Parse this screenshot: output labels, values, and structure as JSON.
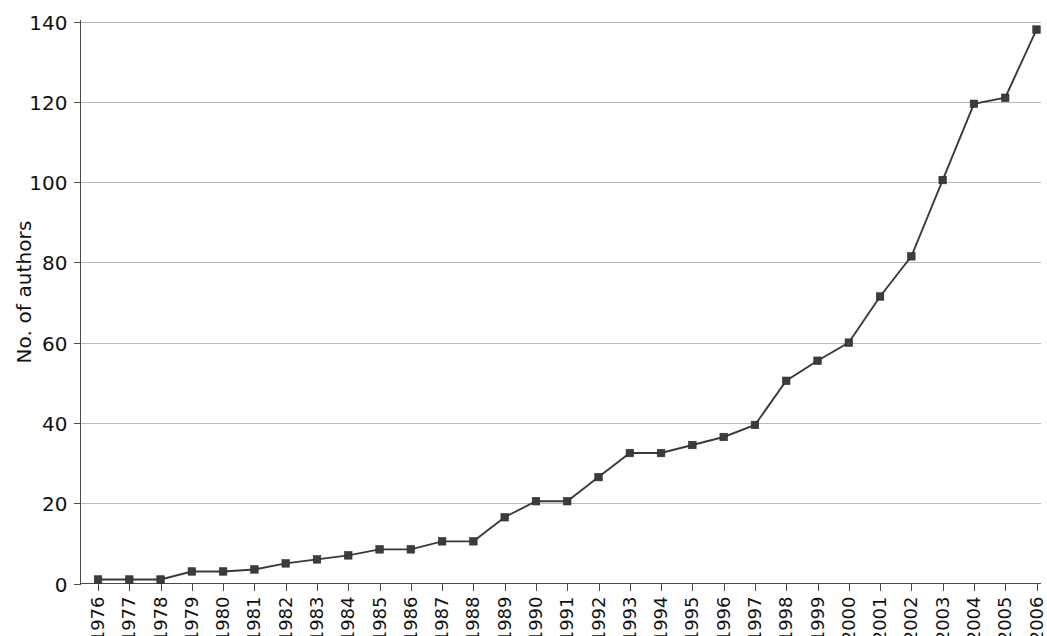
{
  "chart_data": {
    "type": "line",
    "title": "",
    "subtitle": "",
    "xlabel": "",
    "ylabel": "No. of authors",
    "categories": [
      "1976",
      "1977",
      "1978",
      "1979",
      "1980",
      "1981",
      "1982",
      "1983",
      "1984",
      "1985",
      "1986",
      "1987",
      "1988",
      "1989",
      "1990",
      "1991",
      "1992",
      "1993",
      "1994",
      "1995",
      "1996",
      "1997",
      "1998",
      "1999",
      "2000",
      "2001",
      "2002",
      "2003",
      "2004",
      "2005",
      "2006"
    ],
    "values": [
      1,
      1,
      1,
      3,
      3,
      3.5,
      5,
      6,
      7,
      8.5,
      8.5,
      10.5,
      10.5,
      16.5,
      20.5,
      20.5,
      26.5,
      32.5,
      32.5,
      34.5,
      36.5,
      39.5,
      50.5,
      55.5,
      60,
      71.5,
      81.5,
      100.5,
      119.5,
      121,
      138
    ],
    "series": [
      {
        "name": "No. of authors",
        "values": [
          1,
          1,
          1,
          3,
          3,
          3.5,
          5,
          6,
          7,
          8.5,
          8.5,
          10.5,
          10.5,
          16.5,
          20.5,
          20.5,
          26.5,
          32.5,
          32.5,
          34.5,
          36.5,
          39.5,
          50.5,
          55.5,
          60,
          71.5,
          81.5,
          100.5,
          119.5,
          121,
          138
        ]
      }
    ],
    "ylim": [
      0,
      140
    ],
    "yticks": [
      0,
      20,
      40,
      60,
      80,
      100,
      120,
      140
    ],
    "ytick_labels": [
      "0",
      "20",
      "40",
      "60",
      "80",
      "100",
      "120",
      "140"
    ],
    "grid": "horizontal",
    "legend": "none",
    "marker": "square",
    "marker_color": "#3c3c3c",
    "line_color": "#3a3a3a",
    "gridline_color": "#b9b9b9",
    "axis_color": "#4a4a4a",
    "background_color": "#ffffff",
    "xtick_rotation": -90
  }
}
